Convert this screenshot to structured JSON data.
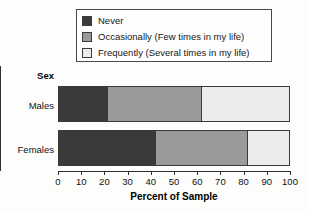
{
  "chart_data": {
    "type": "bar",
    "orientation": "horizontal",
    "stacked": true,
    "title": "",
    "xlabel": "Percent of Sample",
    "ylabel": "Sex",
    "categories": [
      "Males",
      "Females"
    ],
    "xlim": [
      0,
      100
    ],
    "xticks": [
      0,
      10,
      20,
      30,
      40,
      50,
      60,
      70,
      80,
      90,
      100
    ],
    "xticklabels": [
      "0",
      "10",
      "20",
      "30",
      "40",
      "50",
      "60",
      "70",
      "80",
      "90",
      "100"
    ],
    "grid": false,
    "legend_position": "top",
    "series": [
      {
        "name": "Never",
        "color": "#3a3a3a",
        "values": [
          21.5,
          42.0
        ]
      },
      {
        "name": "Occasionally (Few times in my life)",
        "color": "#9a9a9a",
        "values": [
          40.5,
          40.0
        ]
      },
      {
        "name": "Frequently (Several times in my life)",
        "color": "#ececec",
        "values": [
          38.0,
          18.0
        ]
      }
    ],
    "cumulative_boundaries": {
      "Males": [
        21.5,
        62.0,
        100
      ],
      "Females": [
        42.0,
        82.0,
        100
      ]
    }
  },
  "legend": {
    "entries": [
      {
        "label": "Never",
        "swatch": "#3a3a3a"
      },
      {
        "label": "Occasionally (Few times in my life)",
        "swatch": "#9a9a9a"
      },
      {
        "label": "Frequently (Several times in my life)",
        "swatch": "#ececec"
      }
    ]
  },
  "axes": {
    "y_title": "Sex",
    "x_title": "Percent of Sample",
    "category_labels": [
      "Males",
      "Females"
    ],
    "tick_labels": [
      "0",
      "10",
      "20",
      "30",
      "40",
      "50",
      "60",
      "70",
      "80",
      "90",
      "100"
    ]
  },
  "colors": {
    "never": "#3a3a3a",
    "occasionally": "#9a9a9a",
    "frequently": "#ececec",
    "outline": "#3a3a3a",
    "axis": "#2f2f2f",
    "background": "#fdfdfc"
  }
}
